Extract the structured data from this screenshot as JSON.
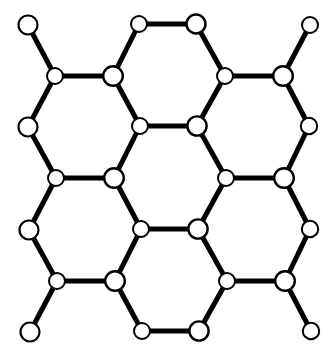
{
  "figure": {
    "kind": "graph-diagram",
    "width": 336,
    "height": 358,
    "background_color": "#ffffff",
    "node_fill_color": "#ffffff",
    "node_stroke_color": "#000000",
    "bond_color": "#000000"
  },
  "graph": {
    "node_count": 28,
    "edge_count": 33,
    "nodes": [
      {
        "id": "n0",
        "x": 28,
        "y": 25,
        "r": 9.5,
        "stroke": 2.2,
        "row": 0,
        "col": 0
      },
      {
        "id": "n1",
        "x": 139,
        "y": 24,
        "r": 8.0,
        "stroke": 2.0,
        "row": 0,
        "col": 1
      },
      {
        "id": "n2",
        "x": 196,
        "y": 24,
        "r": 9.5,
        "stroke": 2.4,
        "row": 0,
        "col": 2
      },
      {
        "id": "n3",
        "x": 310,
        "y": 25,
        "r": 8.0,
        "stroke": 2.0,
        "row": 0,
        "col": 3
      },
      {
        "id": "n4",
        "x": 55,
        "y": 76,
        "r": 8.0,
        "stroke": 2.0,
        "row": 1,
        "col": 0
      },
      {
        "id": "n5",
        "x": 113,
        "y": 76,
        "r": 9.8,
        "stroke": 2.4,
        "row": 1,
        "col": 1
      },
      {
        "id": "n6",
        "x": 225,
        "y": 76,
        "r": 8.0,
        "stroke": 2.0,
        "row": 1,
        "col": 2
      },
      {
        "id": "n7",
        "x": 283,
        "y": 76,
        "r": 9.8,
        "stroke": 2.4,
        "row": 1,
        "col": 3
      },
      {
        "id": "n8",
        "x": 28,
        "y": 127,
        "r": 9.5,
        "stroke": 2.2,
        "row": 2,
        "col": 0
      },
      {
        "id": "n9",
        "x": 140,
        "y": 126,
        "r": 8.0,
        "stroke": 2.0,
        "row": 2,
        "col": 1
      },
      {
        "id": "n10",
        "x": 197,
        "y": 126,
        "r": 9.6,
        "stroke": 2.4,
        "row": 2,
        "col": 2
      },
      {
        "id": "n11",
        "x": 309,
        "y": 126,
        "r": 8.2,
        "stroke": 2.0,
        "row": 2,
        "col": 3
      },
      {
        "id": "n12",
        "x": 56,
        "y": 178,
        "r": 8.0,
        "stroke": 2.0,
        "row": 3,
        "col": 0
      },
      {
        "id": "n13",
        "x": 114,
        "y": 178,
        "r": 9.8,
        "stroke": 2.4,
        "row": 3,
        "col": 1
      },
      {
        "id": "n14",
        "x": 226,
        "y": 178,
        "r": 8.0,
        "stroke": 2.0,
        "row": 3,
        "col": 2
      },
      {
        "id": "n15",
        "x": 284,
        "y": 178,
        "r": 9.8,
        "stroke": 2.4,
        "row": 3,
        "col": 3
      },
      {
        "id": "n16",
        "x": 29,
        "y": 230,
        "r": 9.5,
        "stroke": 2.2,
        "row": 4,
        "col": 0
      },
      {
        "id": "n17",
        "x": 141,
        "y": 229,
        "r": 8.0,
        "stroke": 2.0,
        "row": 4,
        "col": 1
      },
      {
        "id": "n18",
        "x": 198,
        "y": 229,
        "r": 9.6,
        "stroke": 2.4,
        "row": 4,
        "col": 2
      },
      {
        "id": "n19",
        "x": 310,
        "y": 229,
        "r": 8.2,
        "stroke": 2.0,
        "row": 4,
        "col": 3
      },
      {
        "id": "n20",
        "x": 57,
        "y": 281,
        "r": 8.0,
        "stroke": 2.0,
        "row": 5,
        "col": 0
      },
      {
        "id": "n21",
        "x": 115,
        "y": 281,
        "r": 9.8,
        "stroke": 2.4,
        "row": 5,
        "col": 1
      },
      {
        "id": "n22",
        "x": 227,
        "y": 281,
        "r": 8.0,
        "stroke": 2.0,
        "row": 5,
        "col": 2
      },
      {
        "id": "n23",
        "x": 285,
        "y": 281,
        "r": 9.8,
        "stroke": 2.4,
        "row": 5,
        "col": 3
      },
      {
        "id": "n24",
        "x": 30,
        "y": 332,
        "r": 9.5,
        "stroke": 2.2,
        "row": 6,
        "col": 0
      },
      {
        "id": "n25",
        "x": 142,
        "y": 331,
        "r": 8.0,
        "stroke": 2.0,
        "row": 6,
        "col": 1
      },
      {
        "id": "n26",
        "x": 199,
        "y": 331,
        "r": 9.6,
        "stroke": 2.4,
        "row": 6,
        "col": 2
      },
      {
        "id": "n27",
        "x": 311,
        "y": 331,
        "r": 8.2,
        "stroke": 2.0,
        "row": 6,
        "col": 3
      }
    ],
    "edges": [
      {
        "from": "n0",
        "to": "n4",
        "w": 5.0
      },
      {
        "from": "n1",
        "to": "n2",
        "w": 5.0
      },
      {
        "from": "n1",
        "to": "n5",
        "w": 5.0
      },
      {
        "from": "n2",
        "to": "n6",
        "w": 5.0
      },
      {
        "from": "n3",
        "to": "n7",
        "w": 5.0
      },
      {
        "from": "n4",
        "to": "n5",
        "w": 5.2
      },
      {
        "from": "n6",
        "to": "n7",
        "w": 5.2
      },
      {
        "from": "n4",
        "to": "n8",
        "w": 5.0
      },
      {
        "from": "n5",
        "to": "n9",
        "w": 5.0
      },
      {
        "from": "n6",
        "to": "n10",
        "w": 5.0
      },
      {
        "from": "n7",
        "to": "n11",
        "w": 5.0
      },
      {
        "from": "n9",
        "to": "n10",
        "w": 5.2
      },
      {
        "from": "n8",
        "to": "n12",
        "w": 5.0
      },
      {
        "from": "n9",
        "to": "n13",
        "w": 5.0
      },
      {
        "from": "n10",
        "to": "n14",
        "w": 5.0
      },
      {
        "from": "n11",
        "to": "n15",
        "w": 5.0
      },
      {
        "from": "n12",
        "to": "n13",
        "w": 5.2
      },
      {
        "from": "n14",
        "to": "n15",
        "w": 5.2
      },
      {
        "from": "n12",
        "to": "n16",
        "w": 5.0
      },
      {
        "from": "n13",
        "to": "n17",
        "w": 5.0
      },
      {
        "from": "n14",
        "to": "n18",
        "w": 5.0
      },
      {
        "from": "n15",
        "to": "n19",
        "w": 5.0
      },
      {
        "from": "n17",
        "to": "n18",
        "w": 5.2
      },
      {
        "from": "n16",
        "to": "n20",
        "w": 5.0
      },
      {
        "from": "n17",
        "to": "n21",
        "w": 5.0
      },
      {
        "from": "n18",
        "to": "n22",
        "w": 5.0
      },
      {
        "from": "n19",
        "to": "n23",
        "w": 5.0
      },
      {
        "from": "n20",
        "to": "n21",
        "w": 5.2
      },
      {
        "from": "n22",
        "to": "n23",
        "w": 5.2
      },
      {
        "from": "n20",
        "to": "n24",
        "w": 5.0
      },
      {
        "from": "n21",
        "to": "n25",
        "w": 5.0
      },
      {
        "from": "n22",
        "to": "n26",
        "w": 5.0
      },
      {
        "from": "n23",
        "to": "n27",
        "w": 5.0
      },
      {
        "from": "n25",
        "to": "n26",
        "w": 5.0
      }
    ]
  }
}
